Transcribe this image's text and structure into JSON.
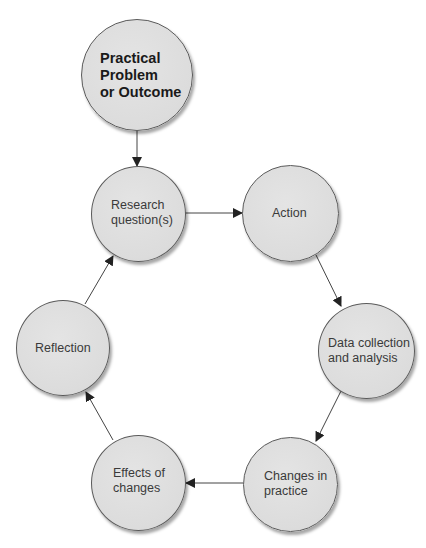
{
  "diagram": {
    "type": "cycle-flowchart",
    "start_node": {
      "id": "practical-problem",
      "label": "Practical\nProblem\nor Outcome"
    },
    "nodes": [
      {
        "id": "research-question",
        "label": "Research\nquestion(s)"
      },
      {
        "id": "action",
        "label": "Action"
      },
      {
        "id": "data-collection",
        "label": "Data collection\nand analysis"
      },
      {
        "id": "changes-in-practice",
        "label": "Changes in\npractice"
      },
      {
        "id": "effects-of-changes",
        "label": "Effects of\nchanges"
      },
      {
        "id": "reflection",
        "label": "Reflection"
      }
    ],
    "edges": [
      {
        "from": "practical-problem",
        "to": "research-question"
      },
      {
        "from": "research-question",
        "to": "action"
      },
      {
        "from": "action",
        "to": "data-collection"
      },
      {
        "from": "data-collection",
        "to": "changes-in-practice"
      },
      {
        "from": "changes-in-practice",
        "to": "effects-of-changes"
      },
      {
        "from": "effects-of-changes",
        "to": "reflection"
      },
      {
        "from": "reflection",
        "to": "research-question"
      }
    ],
    "colors": {
      "node_fill": "#dcdcdc",
      "node_border": "#5a5a5a",
      "arrow": "#333333",
      "text": "#3a3a3a"
    }
  }
}
